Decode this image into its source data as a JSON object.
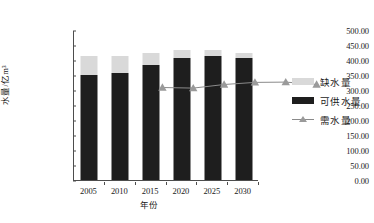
{
  "chart_data": {
    "type": "bar",
    "title": "",
    "subtitle": "",
    "xlabel": "年份",
    "ylabel": "水量/亿m³",
    "categories": [
      "2005",
      "2010",
      "2015",
      "2020",
      "2025",
      "2030"
    ],
    "ylim": [
      0,
      500
    ],
    "ytick_step": 50,
    "ytick_labels": [
      "500.00",
      "450.00",
      "400.00",
      "350.00",
      "300.00",
      "250.00",
      "200.00",
      "150.00",
      "100.00",
      "50.00",
      "0.00"
    ],
    "ytick_values": [
      500,
      450,
      400,
      350,
      300,
      250,
      200,
      150,
      100,
      50,
      0
    ],
    "grid": false,
    "stacked": true,
    "legend_position": "right",
    "series": [
      {
        "name": "可供水量",
        "kind": "bar-segment",
        "color": "#1e1e1e",
        "values": [
          350,
          358,
          385,
          408,
          415,
          408
        ]
      },
      {
        "name": "缺水量",
        "kind": "bar-segment",
        "color": "#d9d9d9",
        "values": [
          65,
          55,
          40,
          24,
          18,
          17
        ]
      },
      {
        "name": "需水量",
        "kind": "line",
        "color": "#8a8a8a",
        "marker": "triangle",
        "marker_color": "#9a9a9a",
        "values": [
          415,
          413,
          425,
          432,
          433,
          425
        ]
      }
    ],
    "legend": [
      {
        "label": "缺水量",
        "swatch": "light-gray-box"
      },
      {
        "label": "可供水量",
        "swatch": "black-box"
      },
      {
        "label": "需水量",
        "swatch": "line-with-triangle-marker"
      }
    ]
  },
  "axis": {
    "y_label": "水量/亿m³",
    "x_label": "年份"
  },
  "colors": {
    "shortage": "#d9d9d9",
    "supply": "#1e1e1e",
    "demand_line": "#8a8a8a",
    "demand_marker": "#9a9a9a",
    "axis": "#4d4d4d"
  }
}
